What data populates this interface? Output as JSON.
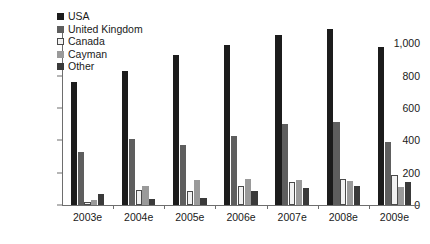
{
  "chart_data": {
    "type": "bar",
    "title": "",
    "subtitle": "",
    "xlabel": "",
    "ylabel": "",
    "categories": [
      "2003e",
      "2004e",
      "2005e",
      "2006e",
      "2007e",
      "2008e",
      "2009e"
    ],
    "ylim": [
      0,
      1100
    ],
    "yticks": [
      0,
      200,
      400,
      600,
      800,
      1000
    ],
    "ytick_labels": [
      "0",
      "200",
      "400",
      "600",
      "800",
      "1,000"
    ],
    "grid": false,
    "legend_position": "top-left",
    "series": [
      {
        "name": "USA",
        "color": "#1c1c1c",
        "values": [
          760,
          830,
          925,
          990,
          1050,
          1085,
          975
        ]
      },
      {
        "name": "United Kingdom",
        "color": "#5e5e5e",
        "values": [
          325,
          405,
          370,
          425,
          500,
          510,
          390
        ]
      },
      {
        "name": "Canada",
        "color": "#f2f2f2",
        "values": [
          20,
          95,
          85,
          120,
          140,
          160,
          185
        ]
      },
      {
        "name": "Cayman",
        "color": "#9a9a9a",
        "values": [
          30,
          115,
          155,
          160,
          155,
          150,
          110
        ]
      },
      {
        "name": "Other",
        "color": "#3a3a3a",
        "values": [
          65,
          35,
          45,
          85,
          105,
          115,
          145
        ]
      }
    ]
  },
  "legend": {
    "items": [
      {
        "label": "USA",
        "swatch": "legend-swatch-usa"
      },
      {
        "label": "United Kingdom",
        "swatch": "legend-swatch-united-kingdom"
      },
      {
        "label": "Canada",
        "swatch": "legend-swatch-canada"
      },
      {
        "label": "Cayman",
        "swatch": "legend-swatch-cayman"
      },
      {
        "label": "Other",
        "swatch": "legend-swatch-other"
      }
    ]
  }
}
